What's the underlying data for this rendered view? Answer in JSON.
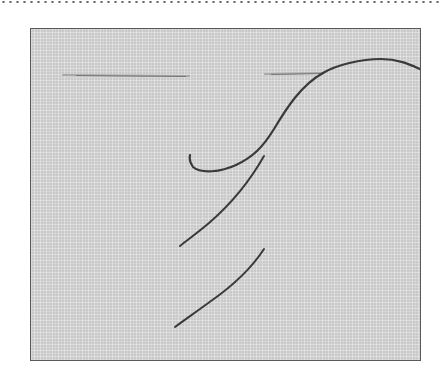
{
  "image": {
    "subject": "embroidery stitch illustration",
    "description": "Needle threaded through woven fabric showing diagonal stitches",
    "colors": {
      "background": "#ffffff",
      "fabric": "#c9c9c9",
      "fabric_border": "#5a5a5a",
      "thread": "#3a3a3a",
      "needle": "#9a9a9a",
      "dotted_rule": "#6a6a6a"
    },
    "elements": [
      {
        "name": "needle",
        "count": 1
      },
      {
        "name": "working-thread",
        "count": 1
      },
      {
        "name": "diagonal-stitch",
        "count": 2
      },
      {
        "name": "thread-loop",
        "count": 1
      }
    ]
  }
}
